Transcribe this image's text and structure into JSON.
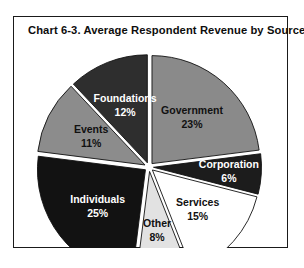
{
  "chart_frame": {
    "title": "Chart 6-3.  Average Respondent Revenue by Source"
  },
  "chart_data": {
    "type": "pie",
    "title": "Chart 6-3.  Average Respondent Revenue by Source",
    "xlabel": "",
    "ylabel": "",
    "legend_position": "none",
    "labels_inside_slices": true,
    "exploded": true,
    "categories": [
      "Government",
      "Corporation",
      "Services",
      "Other",
      "Individuals",
      "Events",
      "Foundations"
    ],
    "values": [
      23,
      6,
      15,
      8,
      25,
      11,
      12
    ],
    "slices": [
      {
        "name": "Government",
        "label": "Government",
        "percent_text": "23%",
        "value": 23,
        "color": "#8a8a8a",
        "text_color": "#111111"
      },
      {
        "name": "Corporation",
        "label": "Corporation",
        "percent_text": "6%",
        "value": 6,
        "color": "#1c1c1c",
        "text_color": "#ffffff"
      },
      {
        "name": "Services",
        "label": "Services",
        "percent_text": "15%",
        "value": 15,
        "color": "#ffffff",
        "text_color": "#111111"
      },
      {
        "name": "Other",
        "label": "Other",
        "percent_text": "8%",
        "value": 8,
        "color": "#e2e2e2",
        "text_color": "#111111"
      },
      {
        "name": "Individuals",
        "label": "Individuals",
        "percent_text": "25%",
        "value": 25,
        "color": "#121212",
        "text_color": "#ffffff"
      },
      {
        "name": "Events",
        "label": "Events",
        "percent_text": "11%",
        "value": 11,
        "color": "#8c8c8c",
        "text_color": "#111111"
      },
      {
        "name": "Foundations",
        "label": "Foundations",
        "percent_text": "12%",
        "value": 12,
        "color": "#2e2e2e",
        "text_color": "#ffffff"
      }
    ]
  }
}
